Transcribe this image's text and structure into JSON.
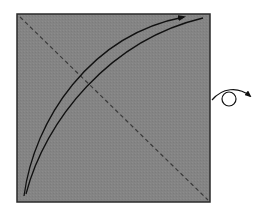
{
  "diagram": {
    "type": "origami-fold-instruction",
    "colors": {
      "paper_fill": "#848484",
      "paper_border": "#2a2a2a",
      "line": "#111111",
      "crease": "#3a3a3a",
      "background": "#ffffff"
    },
    "elements": {
      "paper": "square sheet, colored side up",
      "crease_line": "dashed diagonal valley fold from top-left to bottom-right corner",
      "fold_arrow": "curved arrow from bottom-left corner toward top-right corner",
      "edge_curve": "curved guide line alongside fold arrow",
      "turn_over_symbol": "turn paper over"
    }
  }
}
